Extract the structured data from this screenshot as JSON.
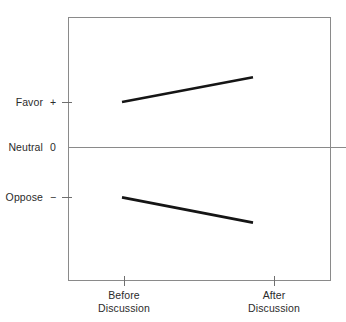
{
  "chart_data": {
    "type": "line",
    "title": "",
    "subtitle": "",
    "xlabel": "",
    "ylabel": "",
    "grid": false,
    "legend": "none",
    "x": [
      "Before Discussion",
      "After Discussion"
    ],
    "categories": [
      "Before Discussion",
      "After Discussion"
    ],
    "ytick_labels": [
      "Favor  +",
      "Neutral  0",
      "Oppose  −"
    ],
    "ytick_values": [
      1,
      0,
      -1
    ],
    "ylim": [
      -2,
      2
    ],
    "annotations": [],
    "series": [
      {
        "name": "Initially favorable group",
        "values": [
          1.0,
          1.55
        ],
        "color": "#151515",
        "direction": "increases toward Favor"
      },
      {
        "name": "Initially opposed group",
        "values": [
          -1.12,
          -1.68
        ],
        "color": "#151515",
        "direction": "decreases toward Oppose"
      }
    ]
  },
  "axes": {
    "y": {
      "ticks": [
        {
          "name": "Favor",
          "symbol": "+"
        },
        {
          "name": "Neutral",
          "symbol": "0"
        },
        {
          "name": "Oppose",
          "symbol": "−"
        }
      ]
    },
    "x": {
      "ticks": [
        {
          "line1": "Before",
          "line2": "Discussion"
        },
        {
          "line1": "After",
          "line2": "Discussion"
        }
      ]
    }
  },
  "style": {
    "frame_color": "#8a8a8a",
    "zero_line_color": "#8a8a8a",
    "tick_color": "#6f6f6f",
    "text_color": "#2b2b2b",
    "series_color": "#151515",
    "background": "#ffffff"
  }
}
